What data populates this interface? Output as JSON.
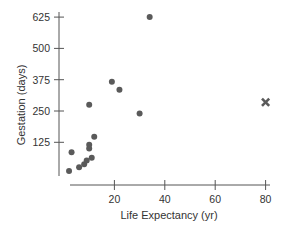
{
  "chart_data": {
    "type": "scatter",
    "title": "",
    "xlabel": "Life Expectancy (yr)",
    "ylabel": "Gestation (days)",
    "xlim": [
      0,
      85
    ],
    "ylim": [
      0,
      640
    ],
    "x_ticks": [
      20,
      40,
      60,
      80
    ],
    "y_ticks": [
      125,
      250,
      375,
      500,
      625
    ],
    "grid": false,
    "legend": null,
    "series": [
      {
        "name": "animals",
        "marker": "circle",
        "color": "#5a5a5a",
        "points": [
          {
            "x": 34,
            "y": 625
          },
          {
            "x": 19,
            "y": 367
          },
          {
            "x": 22,
            "y": 335
          },
          {
            "x": 30,
            "y": 240
          },
          {
            "x": 10,
            "y": 275
          },
          {
            "x": 12,
            "y": 147
          },
          {
            "x": 10,
            "y": 115
          },
          {
            "x": 10,
            "y": 100
          },
          {
            "x": 3,
            "y": 85
          },
          {
            "x": 2,
            "y": 10
          },
          {
            "x": 6,
            "y": 25
          },
          {
            "x": 8,
            "y": 37
          },
          {
            "x": 9,
            "y": 52
          },
          {
            "x": 11,
            "y": 63
          }
        ]
      },
      {
        "name": "highlighted point",
        "marker": "x",
        "color": "#5a5a5a",
        "points": [
          {
            "x": 80,
            "y": 285
          }
        ]
      }
    ]
  },
  "layout": {
    "plot": {
      "x0_px": 64,
      "px_per_x": 2.52,
      "y0_px": 173.6,
      "px_per_y": 0.2504
    },
    "y_axis_x_px": 59,
    "y_axis_top_px": 12,
    "y_axis_bottom_px": 176,
    "x_axis_y_px": 185,
    "x_axis_left_px": 70,
    "x_axis_right_px": 270
  }
}
